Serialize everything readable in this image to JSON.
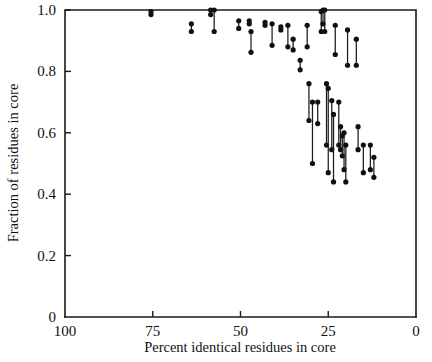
{
  "figure": {
    "width": 432,
    "height": 362,
    "background": "#ffffff",
    "ink_color": "#1a1a1a"
  },
  "chart_data": {
    "type": "scatter",
    "title": "",
    "subtitle": "",
    "xlabel": "Percent identical residues in core",
    "ylabel": "Fraction of residues in core",
    "xlim": [
      100,
      0
    ],
    "ylim": [
      0,
      1.0
    ],
    "x_axis_reversed": true,
    "grid": false,
    "legend": null,
    "xticks": [
      100,
      75,
      50,
      25,
      0
    ],
    "xticklabels": [
      "100",
      "75",
      "50",
      "25",
      "0"
    ],
    "yticks": [
      0,
      0.2,
      0.4,
      0.6,
      0.8,
      1.0
    ],
    "yticklabels": [
      "0",
      "0.2",
      "0.4",
      "0.6",
      "0.8",
      "1.0"
    ],
    "marker": "filled-circle",
    "marker_size_px": 3.0,
    "series_note": "Each datum is a vertical segment with a filled dot at each end: x = percent identical residues in core, y_low and y_high = fraction of residues in core.",
    "points": [
      {
        "x": 75.5,
        "y_high": 0.995,
        "y_low": 0.985
      },
      {
        "x": 64.0,
        "y_high": 0.955,
        "y_low": 0.93
      },
      {
        "x": 58.5,
        "y_high": 1.0,
        "y_low": 0.985
      },
      {
        "x": 57.5,
        "y_high": 1.0,
        "y_low": 0.93
      },
      {
        "x": 50.5,
        "y_high": 0.965,
        "y_low": 0.94
      },
      {
        "x": 47.5,
        "y_high": 0.965,
        "y_low": 0.955
      },
      {
        "x": 47.0,
        "y_high": 0.93,
        "y_low": 0.862
      },
      {
        "x": 43.0,
        "y_high": 0.96,
        "y_low": 0.95
      },
      {
        "x": 41.0,
        "y_high": 0.955,
        "y_low": 0.885
      },
      {
        "x": 38.5,
        "y_high": 0.945,
        "y_low": 0.935
      },
      {
        "x": 36.5,
        "y_high": 0.95,
        "y_low": 0.88
      },
      {
        "x": 35.0,
        "y_high": 0.905,
        "y_low": 0.87
      },
      {
        "x": 33.0,
        "y_high": 0.836,
        "y_low": 0.805
      },
      {
        "x": 31.0,
        "y_high": 0.95,
        "y_low": 0.88
      },
      {
        "x": 30.5,
        "y_high": 0.76,
        "y_low": 0.64
      },
      {
        "x": 29.5,
        "y_high": 0.7,
        "y_low": 0.5
      },
      {
        "x": 28.0,
        "y_high": 0.7,
        "y_low": 0.63
      },
      {
        "x": 27.0,
        "y_high": 0.995,
        "y_low": 0.93
      },
      {
        "x": 26.5,
        "y_high": 1.0,
        "y_low": 0.955
      },
      {
        "x": 26.0,
        "y_high": 1.0,
        "y_low": 0.93
      },
      {
        "x": 25.5,
        "y_high": 0.76,
        "y_low": 0.56
      },
      {
        "x": 25.0,
        "y_high": 0.745,
        "y_low": 0.47
      },
      {
        "x": 24.0,
        "y_high": 0.705,
        "y_low": 0.545
      },
      {
        "x": 23.5,
        "y_high": 0.66,
        "y_low": 0.44
      },
      {
        "x": 23.0,
        "y_high": 0.95,
        "y_low": 0.855
      },
      {
        "x": 22.0,
        "y_high": 0.7,
        "y_low": 0.56
      },
      {
        "x": 21.5,
        "y_high": 0.62,
        "y_low": 0.545
      },
      {
        "x": 21.0,
        "y_high": 0.59,
        "y_low": 0.525
      },
      {
        "x": 20.5,
        "y_high": 0.6,
        "y_low": 0.48
      },
      {
        "x": 20.0,
        "y_high": 0.56,
        "y_low": 0.44
      },
      {
        "x": 19.5,
        "y_high": 0.935,
        "y_low": 0.82
      },
      {
        "x": 17.0,
        "y_high": 0.905,
        "y_low": 0.82
      },
      {
        "x": 16.5,
        "y_high": 0.62,
        "y_low": 0.545
      },
      {
        "x": 15.0,
        "y_high": 0.56,
        "y_low": 0.47
      },
      {
        "x": 13.0,
        "y_high": 0.56,
        "y_low": 0.48
      },
      {
        "x": 12.0,
        "y_high": 0.52,
        "y_low": 0.455
      }
    ]
  },
  "axes": {
    "x_title": "Percent identical residues in core",
    "y_title": "Fraction of residues in core"
  }
}
